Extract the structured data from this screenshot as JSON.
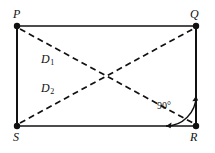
{
  "figure": {
    "type": "geometry-diagram",
    "shape": "rectangle",
    "background_color": "#ffffff",
    "stroke_color": "#111111",
    "vertices": [
      {
        "id": "P",
        "label": "P",
        "x": 17,
        "y": 26
      },
      {
        "id": "Q",
        "label": "Q",
        "x": 196,
        "y": 26
      },
      {
        "id": "R",
        "label": "R",
        "x": 196,
        "y": 126
      },
      {
        "id": "S",
        "label": "S",
        "x": 17,
        "y": 126
      }
    ],
    "sides": [
      {
        "name": "PQ",
        "from": "P",
        "to": "Q",
        "style": "solid"
      },
      {
        "name": "QR",
        "from": "Q",
        "to": "R",
        "style": "solid"
      },
      {
        "name": "RS",
        "from": "R",
        "to": "S",
        "style": "solid"
      },
      {
        "name": "SP",
        "from": "S",
        "to": "P",
        "style": "solid"
      }
    ],
    "diagonals": [
      {
        "name": "D1",
        "label": "D",
        "subscript": "1",
        "from": "P",
        "to": "R",
        "style": "dashed"
      },
      {
        "name": "D2",
        "label": "D",
        "subscript": "2",
        "from": "S",
        "to": "Q",
        "style": "dashed"
      }
    ],
    "angle_marker": {
      "at_vertex": "R",
      "label": "90°",
      "style": "double-arrow-arc"
    }
  }
}
